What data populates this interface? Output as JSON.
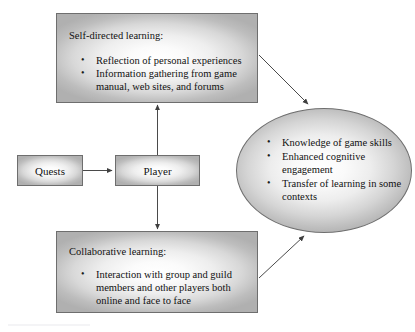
{
  "diagram": {
    "type": "flow-diagram",
    "background_color": "#ffffff",
    "node_border_color": "#6e6e6e",
    "node_fill_light": "#ffffff",
    "node_fill_dark": "#b0b0b0",
    "connector_color": "#4a4a4a",
    "nodes": {
      "quests": {
        "label": "Quests",
        "shape": "rectangle"
      },
      "player": {
        "label": "Player",
        "shape": "rectangle"
      },
      "self_directed": {
        "title": "Self-directed learning:",
        "shape": "rectangle",
        "bullets": [
          "Reflection of personal experiences",
          "Information gathering from game manual, web sites, and forums"
        ]
      },
      "collaborative": {
        "title": "Collaborative learning:",
        "shape": "rectangle",
        "bullets": [
          "Interaction with group and guild members and other players both online and face to face"
        ]
      },
      "outcomes": {
        "shape": "ellipse",
        "bullets": [
          "Knowledge of game skills",
          "Enhanced cognitive engagement",
          "Transfer of learning in some contexts"
        ]
      }
    },
    "connectors": [
      {
        "name": "quests-to-player",
        "from": "quests",
        "to": "player",
        "style": "arrow"
      },
      {
        "name": "player-to-self-directed",
        "from": "player",
        "to": "self_directed",
        "style": "arrow"
      },
      {
        "name": "player-to-collaborative",
        "from": "player",
        "to": "collaborative",
        "style": "arrow"
      },
      {
        "name": "self-directed-to-outcomes",
        "from": "self_directed",
        "to": "outcomes",
        "style": "arrow"
      },
      {
        "name": "collaborative-to-outcomes",
        "from": "collaborative",
        "to": "outcomes",
        "style": "arrow"
      }
    ]
  }
}
